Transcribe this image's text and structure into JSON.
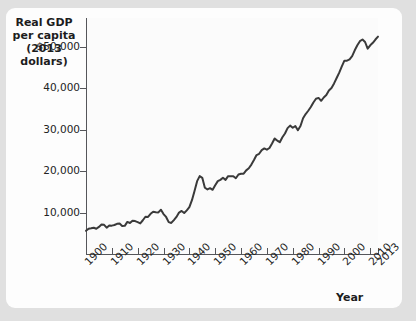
{
  "chart_data": {
    "type": "line",
    "title": "",
    "ylabel": "Real GDP per capita (2013 dollars)",
    "ylabel_lines": [
      "Real GDP",
      "per capita",
      "(2013 dollars)"
    ],
    "xlabel": "Year",
    "xlim": [
      1900,
      2013
    ],
    "ylim": [
      0,
      57000
    ],
    "grid": false,
    "legend": null,
    "y_ticks": [
      10000,
      20000,
      30000,
      40000,
      50000
    ],
    "y_tick_labels": [
      "10,000",
      "20,000",
      "30,000",
      "40,000",
      "$50,000"
    ],
    "x_ticks": [
      1900,
      1910,
      1920,
      1930,
      1940,
      1950,
      1960,
      1970,
      1980,
      1990,
      2000,
      2010,
      2013
    ],
    "x_tick_labels": [
      "1900",
      "1910",
      "1920",
      "1930",
      "1940",
      "1950",
      "1960",
      "1970",
      "1980",
      "1990",
      "2000",
      "2010",
      "2013"
    ],
    "line_color": "#3a3a3a",
    "series": [
      {
        "name": "Real GDP per capita",
        "x": [
          1900,
          1901,
          1902,
          1903,
          1904,
          1905,
          1906,
          1907,
          1908,
          1909,
          1910,
          1911,
          1912,
          1913,
          1914,
          1915,
          1916,
          1917,
          1918,
          1919,
          1920,
          1921,
          1922,
          1923,
          1924,
          1925,
          1926,
          1927,
          1928,
          1929,
          1930,
          1931,
          1932,
          1933,
          1934,
          1935,
          1936,
          1937,
          1938,
          1939,
          1940,
          1941,
          1942,
          1943,
          1944,
          1945,
          1946,
          1947,
          1948,
          1949,
          1950,
          1951,
          1952,
          1953,
          1954,
          1955,
          1956,
          1957,
          1958,
          1959,
          1960,
          1961,
          1962,
          1963,
          1964,
          1965,
          1966,
          1967,
          1968,
          1969,
          1970,
          1971,
          1972,
          1973,
          1974,
          1975,
          1976,
          1977,
          1978,
          1979,
          1980,
          1981,
          1982,
          1983,
          1984,
          1985,
          1986,
          1987,
          1988,
          1989,
          1990,
          1991,
          1992,
          1993,
          1994,
          1995,
          1996,
          1997,
          1998,
          1999,
          2000,
          2001,
          2002,
          2003,
          2004,
          2005,
          2006,
          2007,
          2008,
          2009,
          2010,
          2011,
          2012,
          2013
        ],
        "values": [
          5600,
          6100,
          6200,
          6350,
          6100,
          6550,
          7100,
          7050,
          6350,
          6900,
          6850,
          7000,
          7300,
          7350,
          6750,
          6800,
          7750,
          7500,
          8050,
          7950,
          7700,
          7400,
          8150,
          9000,
          8950,
          9700,
          10200,
          10100,
          10050,
          10700,
          9650,
          8950,
          7700,
          7500,
          8200,
          8950,
          10000,
          10400,
          9900,
          10550,
          11300,
          13000,
          15200,
          17600,
          18800,
          18400,
          16000,
          15600,
          15900,
          15500,
          16600,
          17600,
          17900,
          18400,
          17900,
          18800,
          18800,
          18800,
          18300,
          19200,
          19400,
          19400,
          20200,
          20700,
          21600,
          22700,
          23900,
          24200,
          25100,
          25500,
          25200,
          25600,
          26700,
          27900,
          27400,
          27000,
          28200,
          29100,
          30400,
          31000,
          30500,
          30900,
          29900,
          30900,
          32800,
          33800,
          34600,
          35500,
          36600,
          37500,
          37700,
          37000,
          37800,
          38400,
          39500,
          40100,
          41200,
          42500,
          43800,
          45300,
          46700,
          46700,
          47000,
          47800,
          49200,
          50400,
          51400,
          51800,
          51200,
          49600,
          50400,
          51000,
          51800,
          52500
        ],
        "annotations": [
          {
            "label": "Great Depression trough",
            "year": 1933,
            "value": 7500
          },
          {
            "label": "World War II peak",
            "year": 1944,
            "value": 18800
          },
          {
            "label": "Great Recession trough",
            "year": 2009,
            "value": 49600
          }
        ]
      }
    ]
  }
}
